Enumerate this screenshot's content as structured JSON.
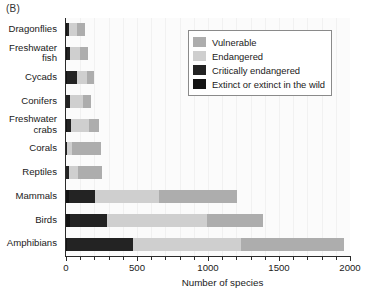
{
  "panel": {
    "label": "(B)"
  },
  "legend": {
    "items": [
      {
        "label": "Vulnerable",
        "color": "#adadad",
        "key": "vulnerable"
      },
      {
        "label": "Endangered",
        "color": "#cfcfcf",
        "key": "endangered"
      },
      {
        "label": "Critically endangered",
        "color": "#232323",
        "key": "critical"
      },
      {
        "label": "Extinct or extinct in the wild",
        "color": "#141414",
        "key": "extinct"
      }
    ]
  },
  "chart_data": {
    "type": "bar",
    "orientation": "horizontal",
    "stacked": true,
    "title": "",
    "xlabel": "Number of species",
    "ylabel": "",
    "xlim": [
      0,
      2000
    ],
    "xticks": [
      0,
      500,
      1000,
      1500,
      2000
    ],
    "xtick_labels": [
      "0",
      "500",
      "1000",
      "1500",
      "2000"
    ],
    "minor_tick_step": 100,
    "grid": "faint-vertical",
    "legend_position": "top-right-inset",
    "categories": [
      "Dragonflies",
      "Freshwater\nfish",
      "Cycads",
      "Conifers",
      "Freshwater\ncrabs",
      "Corals",
      "Reptiles",
      "Mammals",
      "Birds",
      "Amphibians"
    ],
    "series": [
      {
        "name": "Extinct or extinct in the wild",
        "color": "#141414",
        "values": [
          5,
          10,
          4,
          2,
          4,
          0,
          3,
          20,
          25,
          10
        ]
      },
      {
        "name": "Critically endangered",
        "color": "#232323",
        "values": [
          15,
          20,
          75,
          25,
          30,
          5,
          20,
          185,
          265,
          460
        ]
      },
      {
        "name": "Endangered",
        "color": "#cfcfcf",
        "values": [
          60,
          70,
          70,
          95,
          130,
          40,
          65,
          450,
          700,
          760
        ]
      },
      {
        "name": "Vulnerable",
        "color": "#adadad",
        "values": [
          55,
          55,
          45,
          55,
          70,
          205,
          165,
          550,
          400,
          730
        ]
      }
    ],
    "totals": [
      135,
      155,
      194,
      177,
      234,
      250,
      253,
      1205,
      1390,
      1960
    ]
  }
}
